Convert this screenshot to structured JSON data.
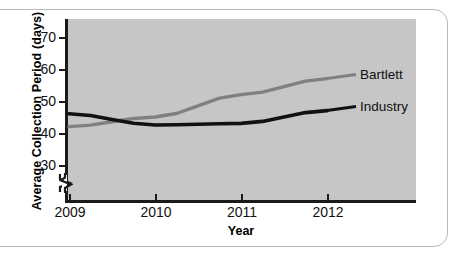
{
  "chart_data": {
    "type": "line",
    "title": "",
    "xlabel": "Year",
    "ylabel": "Average Collection Period (days)",
    "x": [
      2009,
      2010,
      2011,
      2012
    ],
    "xticklabels": [
      "2009",
      "2010",
      "2011",
      "2012"
    ],
    "yticks": [
      30,
      40,
      50,
      60,
      70
    ],
    "yticklabels": [
      "30",
      "40",
      "50",
      "60",
      "70"
    ],
    "ylim": [
      27,
      74
    ],
    "xlim": [
      2009,
      2012
    ],
    "y_axis_break": true,
    "grid": false,
    "legend_position": "right-inline-labels",
    "series": [
      {
        "name": "Bartlett",
        "color": "#808080",
        "values": [
          42,
          45,
          52,
          57
        ]
      },
      {
        "name": "Industry",
        "color": "#111111",
        "values": [
          46,
          42.5,
          43,
          47
        ]
      }
    ]
  },
  "axes": {
    "y_title": "Average Collection Period (days)",
    "x_title": "Year",
    "y_ticks": [
      {
        "value": 70,
        "label": "70"
      },
      {
        "value": 60,
        "label": "60"
      },
      {
        "value": 50,
        "label": "50"
      },
      {
        "value": 40,
        "label": "40"
      },
      {
        "value": 30,
        "label": "30"
      }
    ],
    "x_ticks": [
      {
        "value": 2009,
        "label": "2009"
      },
      {
        "value": 2010,
        "label": "2010"
      },
      {
        "value": 2011,
        "label": "2011"
      },
      {
        "value": 2012,
        "label": "2012"
      }
    ]
  },
  "legend": {
    "bartlett_label": "Bartlett",
    "industry_label": "Industry"
  },
  "colors": {
    "plot_background": "#c6c6c6",
    "page_background": "#ffffff",
    "frame_border": "#b9b9b9",
    "axis": "#1a1a1a",
    "bartlett_line": "#808080",
    "industry_line": "#111111",
    "text": "#111111"
  }
}
